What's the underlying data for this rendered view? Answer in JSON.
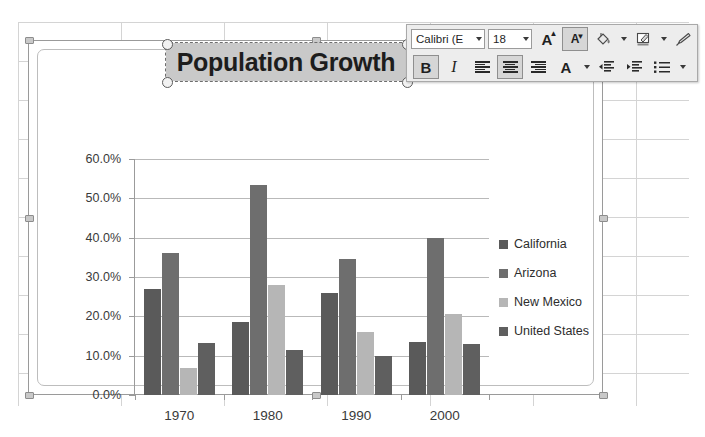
{
  "chart_data": {
    "type": "bar",
    "title": "Population Growth",
    "xlabel": "",
    "ylabel": "",
    "categories": [
      "1970",
      "1980",
      "1990",
      "2000"
    ],
    "ylim": [
      0,
      60
    ],
    "ytick_labels": [
      "0.0%",
      "10.0%",
      "20.0%",
      "30.0%",
      "40.0%",
      "50.0%",
      "60.0%"
    ],
    "ytick_values": [
      0,
      10,
      20,
      30,
      40,
      50,
      60
    ],
    "grid": true,
    "legend_position": "right",
    "series": [
      {
        "name": "California",
        "color": "#5a5a5a",
        "values": [
          27.0,
          18.5,
          26.0,
          13.5
        ]
      },
      {
        "name": "Arizona",
        "color": "#6e6e6e",
        "values": [
          36.0,
          53.5,
          34.5,
          40.0
        ]
      },
      {
        "name": "New Mexico",
        "color": "#b6b6b6",
        "values": [
          6.8,
          28.0,
          16.0,
          20.5
        ]
      },
      {
        "name": "United States",
        "color": "#5f5f5f",
        "values": [
          13.2,
          11.5,
          10.0,
          13.0
        ]
      }
    ]
  },
  "mini_toolbar": {
    "font_name": "Calibri (E",
    "font_size": "18",
    "grow_font_label": "A",
    "shrink_font_label": "A",
    "fill_color_label": "",
    "text_highlight_label": "",
    "format_painter_label": "",
    "bold_label": "B",
    "italic_label": "I",
    "font_color_label": "A",
    "align_left_label": "",
    "align_center_label": "",
    "align_right_label": "",
    "decrease_indent_label": "",
    "increase_indent_label": "",
    "bullets_label": ""
  },
  "colors": {
    "chart_border": "#9a9a9a",
    "plot_border": "#bdbdbd",
    "gridline": "#b9b9b9",
    "axis": "#9b9b9b",
    "title_selection": "#c9c9c9",
    "sheet_grid": "#d4d4d4"
  }
}
